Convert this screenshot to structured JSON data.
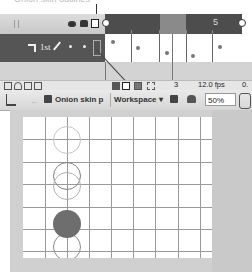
{
  "callout": {
    "text": "Onion skin outlines"
  },
  "timeline": {
    "header": {
      "icons": [
        "eye-icon",
        "lock-icon",
        "outline-icon"
      ],
      "frame_label": "5"
    },
    "layer": {
      "name": "1st"
    },
    "keyframe_dots": [
      {
        "x": 111,
        "y": 40
      },
      {
        "x": 136,
        "y": 46
      },
      {
        "x": 165,
        "y": 51
      },
      {
        "x": 191,
        "y": 54
      },
      {
        "x": 218,
        "y": 45
      }
    ],
    "frame_dividers_x": [
      131,
      159,
      186,
      212
    ],
    "footer": {
      "current_frame": "3",
      "frame_rate": "12.0 fps",
      "elapsed": "0."
    }
  },
  "edit_bar": {
    "scene_label": "Onion skin p",
    "workspace_label": "Workspace ▾",
    "zoom_value": "50%"
  },
  "stage": {
    "grid_cols_x": [
      22,
      44,
      66,
      88,
      110,
      132,
      155,
      177
    ],
    "grid_rows_y": [
      22,
      45,
      67,
      90,
      112,
      134
    ],
    "ghost_circles": [
      {
        "left": 30,
        "top": 9,
        "color": "#c4c4c4"
      },
      {
        "left": 30,
        "top": 45,
        "color": "#808080"
      },
      {
        "left": 30,
        "top": 55,
        "color": "#b0b0b0"
      },
      {
        "left": 30,
        "top": 116,
        "color": "#8a8a8a"
      }
    ],
    "current_ball": {
      "left": 30,
      "top": 93,
      "color": "#6e6e6e"
    }
  }
}
